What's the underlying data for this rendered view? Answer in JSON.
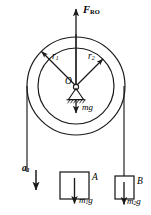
{
  "figure": {
    "kind": "free-body-diagram",
    "stroke_color": "#1a1a1a",
    "background_color": "#ffffff"
  },
  "labels": {
    "applied_force": {
      "symbol": "F",
      "subscript": "RO",
      "text": "F_RO"
    },
    "radius_outer": {
      "symbol": "r",
      "subscript": "1",
      "text": "r_1"
    },
    "radius_inner": {
      "symbol": "r",
      "subscript": "2",
      "text": "r_2"
    },
    "center": {
      "text": "O"
    },
    "pulley_weight": {
      "symbol": "mg",
      "text": "mg"
    },
    "acceleration_left": {
      "symbol": "a",
      "subscript": "1",
      "text": "a_1"
    },
    "block_left": {
      "text": "A"
    },
    "block_right": {
      "text": "B"
    },
    "weight_left": {
      "symbol": "m",
      "subscript": "1",
      "suffix": "g",
      "text": "m_1 g"
    },
    "weight_right": {
      "symbol": "m",
      "subscript": "2",
      "suffix": "g",
      "text": "m_2 g"
    }
  },
  "geometry": {
    "center": {
      "x": 76,
      "y": 86
    },
    "outer_radius": 49,
    "inner_radius": 38,
    "force_arrow_top_y": 8,
    "weight_arrow_bottom_y": 112,
    "rope_left_x": 27,
    "rope_right_x": 124,
    "rope_bottom_left_y": 172,
    "rope_bottom_right_y": 176,
    "block_a": {
      "x": 60,
      "y": 172,
      "w": 29,
      "h": 27
    },
    "block_b": {
      "x": 115,
      "y": 176,
      "w": 19,
      "h": 23
    }
  }
}
